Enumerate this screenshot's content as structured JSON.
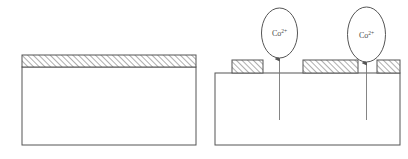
{
  "figure": {
    "name": "cobalt-ion-adsorption-schematic",
    "panels": [
      {
        "id": "panel-left",
        "name": "pristine-substrate-panel",
        "substrate": {
          "name": "substrate-block",
          "x": 22,
          "y": 67,
          "width": 174,
          "height": 78,
          "fill": "#ffffff",
          "stroke": "#555555"
        },
        "coating": {
          "name": "hatched-coating-layer",
          "x": 22,
          "y": 55,
          "width": 174,
          "height": 12,
          "fill": "#ffffff",
          "stroke": "#555555",
          "hatch": "diagonal-45"
        },
        "blocks": [],
        "ions": []
      },
      {
        "id": "panel-right",
        "name": "ion-adsorption-panel",
        "substrate": {
          "name": "substrate-block",
          "x": 215,
          "y": 73,
          "width": 185,
          "height": 72,
          "fill": "#ffffff",
          "stroke": "#555555"
        },
        "coating": null,
        "blocks": [
          {
            "name": "hatched-island-1",
            "x": 232,
            "y": 60,
            "width": 31,
            "height": 13
          },
          {
            "name": "hatched-island-2",
            "x": 303,
            "y": 60,
            "width": 55,
            "height": 13
          },
          {
            "name": "hatched-island-3",
            "x": 377,
            "y": 60,
            "width": 23,
            "height": 13
          }
        ],
        "ions": [
          {
            "name": "cobalt-ion-bubble-1",
            "label": "Co",
            "charge": "2+",
            "cx": 279.5,
            "cy": 33,
            "rx": 18,
            "ry": 25,
            "arrow": {
              "x": 279.5,
              "y_tail": 120,
              "y_head": 58
            }
          },
          {
            "name": "cobalt-ion-bubble-2",
            "label": "Co",
            "charge": "2+",
            "cx": 366.5,
            "cy": 34.5,
            "rx": 19,
            "ry": 27.5,
            "arrow": {
              "x": 366.5,
              "y_tail": 120,
              "y_head": 62
            }
          }
        ]
      }
    ],
    "colors": {
      "outline": "#555555",
      "hatch": "#6b6b6b",
      "fill": "#ffffff",
      "text": "#4a4a4a",
      "arrow": "#777777",
      "background": "#ffffff"
    }
  }
}
